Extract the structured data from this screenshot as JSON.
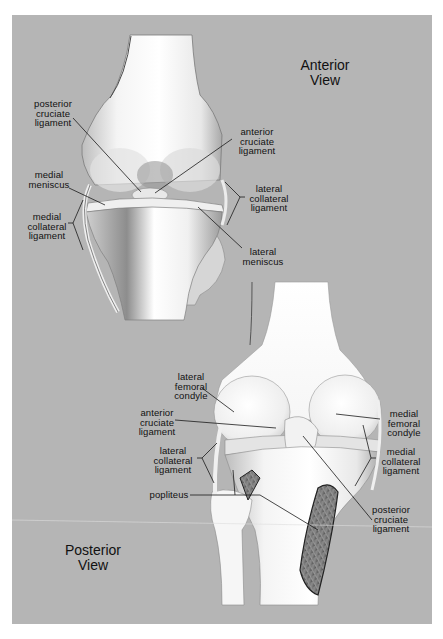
{
  "diagram": {
    "background_color": "#b5b5b5",
    "anterior": {
      "title": "Anterior\nView",
      "labels": {
        "posterior_cruciate_ligament": "posterior\ncruciate\nligament",
        "anterior_cruciate_ligament": "anterior\ncruciate\nligament",
        "medial_meniscus": "medial\nmeniscus",
        "lateral_collateral_ligament": "lateral\ncollateral\nligament",
        "medial_collateral_ligament": "medial\ncollateral\nligament",
        "lateral_meniscus": "lateral\nmeniscus"
      }
    },
    "posterior": {
      "title": "Posterior\nView",
      "labels": {
        "lateral_femoral_condyle": "lateral\nfemoral\ncondyle",
        "anterior_cruciate_ligament": "anterior\ncruciate\nligament",
        "medial_femoral_condyle": "medial\nfemoral\ncondyle",
        "lateral_collateral_ligament": "lateral\ncollateral\nligament",
        "medial_collateral_ligament": "medial\ncollateral\nligament",
        "popliteus": "popliteus",
        "posterior_cruciate_ligament": "posterior\ncruciate\nligament"
      }
    }
  }
}
